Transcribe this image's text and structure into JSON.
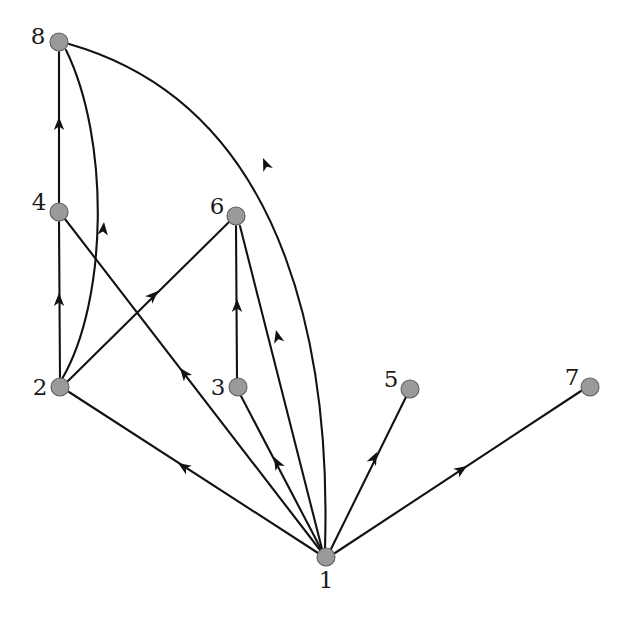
{
  "figure": {
    "width": 624,
    "height": 623,
    "background_color": "#ffffff"
  },
  "style": {
    "node_fill": "#9a9a9a",
    "node_stroke": "#5e5e5e",
    "node_radius": 9,
    "edge_color": "#121212",
    "edge_width": 2.1,
    "label_color": "#1a1a1a",
    "label_font_size": 23
  },
  "graph_data": {
    "type": "directed-graph",
    "directed": true,
    "node_count": 8,
    "edge_count": 12,
    "nodes": [
      {
        "id": "1",
        "label": "1",
        "x": 326,
        "y": 557,
        "label_x": 326,
        "label_y": 588,
        "label_anchor": "middle"
      },
      {
        "id": "2",
        "label": "2",
        "x": 60,
        "y": 387,
        "label_x": 40,
        "label_y": 395,
        "label_anchor": "middle"
      },
      {
        "id": "3",
        "label": "3",
        "x": 238,
        "y": 387,
        "label_x": 218,
        "label_y": 395,
        "label_anchor": "middle"
      },
      {
        "id": "4",
        "label": "4",
        "x": 59,
        "y": 212,
        "label_x": 39,
        "label_y": 210,
        "label_anchor": "middle"
      },
      {
        "id": "5",
        "label": "5",
        "x": 410,
        "y": 389,
        "label_x": 391,
        "label_y": 387,
        "label_anchor": "middle"
      },
      {
        "id": "6",
        "label": "6",
        "x": 236,
        "y": 216,
        "label_x": 217,
        "label_y": 214,
        "label_anchor": "middle"
      },
      {
        "id": "7",
        "label": "7",
        "x": 590,
        "y": 387,
        "label_x": 572,
        "label_y": 385,
        "label_anchor": "middle"
      },
      {
        "id": "8",
        "label": "8",
        "x": 59,
        "y": 42,
        "label_x": 38,
        "label_y": 44,
        "label_anchor": "middle"
      }
    ],
    "edges": [
      {
        "id": "e-4-8",
        "source": "4",
        "target": "8",
        "shape": "straight",
        "path": "M 59 203 L 59 52",
        "arrow_x": 59,
        "arrow_y": 117,
        "arrow_angle": -90
      },
      {
        "id": "e-2-4",
        "source": "2",
        "target": "4",
        "shape": "straight",
        "path": "M 60 378 L 59 222",
        "arrow_x": 59,
        "arrow_y": 293,
        "arrow_angle": -90
      },
      {
        "id": "e-2-8",
        "source": "2",
        "target": "8",
        "shape": "curved",
        "path": "M 62 379 C 108 300 110 140 66 50",
        "arrow_x": 104,
        "arrow_y": 222,
        "arrow_angle": -84
      },
      {
        "id": "e-2-6",
        "source": "2",
        "target": "6",
        "shape": "straight",
        "path": "M 68 381 L 229 222",
        "arrow_x": 158,
        "arrow_y": 291,
        "arrow_angle": -44
      },
      {
        "id": "e-3-6",
        "source": "3",
        "target": "6",
        "shape": "straight",
        "path": "M 237 378 L 236 226",
        "arrow_x": 237,
        "arrow_y": 299,
        "arrow_angle": -90
      },
      {
        "id": "e-1-8",
        "source": "1",
        "target": "8",
        "shape": "curved",
        "path": "M 325 548 C 330 380 300 110 69 44",
        "arrow_x": 263,
        "arrow_y": 158,
        "arrow_angle": -113
      },
      {
        "id": "e-1-2",
        "source": "1",
        "target": "2",
        "shape": "straight",
        "path": "M 318 553 L 69 392",
        "arrow_x": 178,
        "arrow_y": 463,
        "arrow_angle": 213
      },
      {
        "id": "e-1-4",
        "source": "1",
        "target": "4",
        "shape": "straight",
        "path": "M 320 550 L 65 219",
        "arrow_x": 180,
        "arrow_y": 368,
        "arrow_angle": 232
      },
      {
        "id": "e-1-6",
        "source": "1",
        "target": "6",
        "shape": "straight",
        "path": "M 322 549 L 240 226",
        "arrow_x": 276,
        "arrow_y": 330,
        "arrow_angle": 256
      },
      {
        "id": "e-1-3",
        "source": "1",
        "target": "3",
        "shape": "straight",
        "path": "M 321 549 L 241 396",
        "arrow_x": 274,
        "arrow_y": 457,
        "arrow_angle": 242
      },
      {
        "id": "e-1-5",
        "source": "1",
        "target": "5",
        "shape": "straight",
        "path": "M 331 549 L 406 397",
        "arrow_x": 377,
        "arrow_y": 452,
        "arrow_angle": -64
      },
      {
        "id": "e-1-7",
        "source": "1",
        "target": "7",
        "shape": "straight",
        "path": "M 335 553 L 581 391",
        "arrow_x": 467,
        "arrow_y": 466,
        "arrow_angle": -33
      }
    ],
    "edge_list_text": [
      "1 -> 2",
      "1 -> 3",
      "1 -> 4",
      "1 -> 5",
      "1 -> 6",
      "1 -> 7",
      "1 -> 8",
      "2 -> 4",
      "2 -> 6",
      "2 -> 8",
      "3 -> 6",
      "4 -> 8"
    ],
    "node_labels": [
      "1",
      "2",
      "3",
      "4",
      "5",
      "6",
      "7",
      "8"
    ]
  }
}
